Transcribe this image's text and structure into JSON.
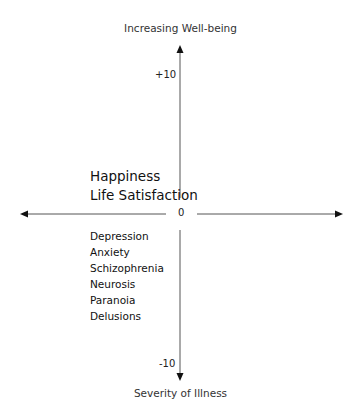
{
  "diagram": {
    "y_axis": {
      "top_label": "Increasing Well-being",
      "bottom_label": "Severity of Illness",
      "max_tick": "+10",
      "min_tick": "-10"
    },
    "origin_label": "0",
    "positive_items": [
      "Happiness",
      "Life Satisfaction"
    ],
    "negative_items": [
      "Depression",
      "Anxiety",
      "Schizophrenia",
      "Neurosis",
      "Paranoia",
      "Delusions"
    ],
    "colors": {
      "line": "#555555",
      "text": "#222222"
    }
  }
}
